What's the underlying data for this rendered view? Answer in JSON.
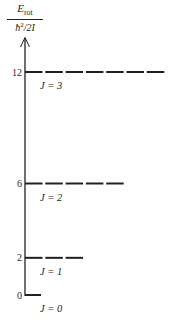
{
  "diagram": {
    "ylabel": {
      "numerator_symbol": "E",
      "numerator_subscript": "rot",
      "denominator": "ħ",
      "denominator_power": "2",
      "denominator_rest": "/2I"
    },
    "axis": {
      "min": 0,
      "max": 12,
      "direction": "up-arrow"
    },
    "colors": {
      "ink": "#231f20"
    },
    "levels": [
      {
        "J": 0,
        "energy": 0,
        "tick_label": "0",
        "label": "J = 0",
        "dashes": 0
      },
      {
        "J": 1,
        "energy": 2,
        "tick_label": "2",
        "label": "J = 1",
        "dashes": 3
      },
      {
        "J": 2,
        "energy": 6,
        "tick_label": "6",
        "label": "J = 2",
        "dashes": 5
      },
      {
        "J": 3,
        "energy": 12,
        "tick_label": "12",
        "label": "J = 3",
        "dashes": 7
      }
    ]
  }
}
